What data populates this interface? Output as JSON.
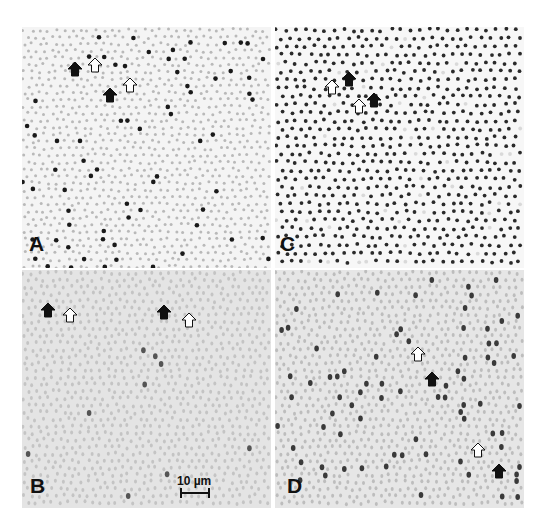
{
  "figure": {
    "panels": [
      {
        "id": "A",
        "label": "A",
        "background": "#f4f4f4",
        "cell_color": "#b9b9b9",
        "labeled_color": "#1a1a1a",
        "labeled_density": "sparse",
        "arrows": [
          {
            "type": "filled",
            "x": 75,
            "y": 70
          },
          {
            "type": "open",
            "x": 95,
            "y": 66
          },
          {
            "type": "filled",
            "x": 110,
            "y": 96
          },
          {
            "type": "open",
            "x": 130,
            "y": 86
          }
        ]
      },
      {
        "id": "C",
        "label": "C",
        "background": "#f7f7f7",
        "cell_color": "#2a2a2a",
        "labeled_color": "#2a2a2a",
        "labeled_density": "dense",
        "arrows": [
          {
            "type": "open",
            "x": 332,
            "y": 88
          },
          {
            "type": "filled",
            "x": 349,
            "y": 80
          },
          {
            "type": "open",
            "x": 359,
            "y": 107
          },
          {
            "type": "filled",
            "x": 374,
            "y": 101
          }
        ]
      },
      {
        "id": "B",
        "label": "B",
        "background": "#e4e4e4",
        "cell_color": "#c4c4c4",
        "labeled_color": "#555555",
        "labeled_density": "very-sparse",
        "arrows": [
          {
            "type": "filled",
            "x": 48,
            "y": 311
          },
          {
            "type": "open",
            "x": 70,
            "y": 316
          },
          {
            "type": "filled",
            "x": 164,
            "y": 313
          },
          {
            "type": "open",
            "x": 189,
            "y": 321
          }
        ]
      },
      {
        "id": "D",
        "label": "D",
        "background": "#e6e6e6",
        "cell_color": "#bdbdbd",
        "labeled_color": "#3a3a3a",
        "labeled_density": "sparse",
        "arrows": [
          {
            "type": "open",
            "x": 418,
            "y": 355
          },
          {
            "type": "filled",
            "x": 432,
            "y": 380
          },
          {
            "type": "open",
            "x": 478,
            "y": 451
          },
          {
            "type": "filled",
            "x": 499,
            "y": 472
          }
        ]
      }
    ],
    "scale_bar": {
      "label": "10 µm",
      "panel": "B"
    },
    "legend_arrows": {
      "filled": "filled-arrow",
      "open": "open-arrow"
    }
  }
}
